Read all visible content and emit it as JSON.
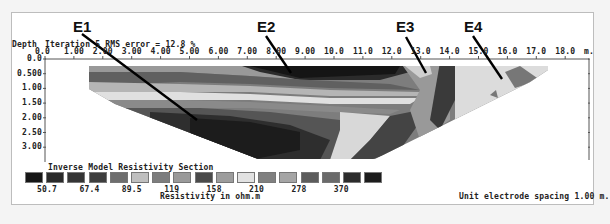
{
  "chart_data": {
    "type": "heatmap",
    "title": "Inverse Model Resistivity Section",
    "header": "Iteration 5 RMS error = 12.8 %",
    "xlabel": "m.",
    "ylabel": "Depth",
    "x_ticks": [
      "0.0",
      "1.00",
      "2.00",
      "3.00",
      "4.00",
      "5.00",
      "6.00",
      "7.00",
      "8.00",
      "9.00",
      "10.0",
      "11.0",
      "12.0",
      "13.0",
      "14.0",
      "15.0",
      "16.0",
      "17.0",
      "18.0"
    ],
    "y_ticks": [
      "0.0",
      "0.500",
      "1.00",
      "1.50",
      "2.00",
      "2.50",
      "3.00"
    ],
    "xlim": [
      0,
      18.5
    ],
    "ylim": [
      0,
      3.4
    ],
    "colorbar": {
      "label": "Resistivity in ohm.m",
      "tick_labels": [
        "50.7",
        "67.4",
        "89.5",
        "119",
        "158",
        "210",
        "278",
        "370"
      ],
      "colors": [
        "#161616",
        "#2a2a2a",
        "#353535",
        "#3e3e3e",
        "#6e6e6e",
        "#bfbfbf",
        "#7d7d7d",
        "#9a9a9a",
        "#4a4a4a",
        "#9c9c9c",
        "#e2e2e2",
        "#808080",
        "#a5a5a5",
        "#5c5c5c",
        "#6a6a6a",
        "#2c2c2c",
        "#1c1c1c"
      ]
    },
    "annotations": [
      {
        "label": "E1",
        "x_m": 3.9,
        "depth_m": 2.1
      },
      {
        "label": "E2",
        "x_m": 8.2,
        "depth_m": 0.55
      },
      {
        "label": "E3",
        "x_m": 13.3,
        "depth_m": 0.55
      },
      {
        "label": "E4",
        "x_m": 16.0,
        "depth_m": 0.7
      }
    ],
    "footer": "Unit electrode spacing 1.00 m."
  },
  "labels": {
    "depth": "Depth",
    "header": "Iteration 5 RMS error = 12.8 %",
    "unit_m": "m.",
    "section_title": "Inverse Model Resistivity Section",
    "colorbar_label": "Resistivity in ohm.m",
    "footer": "Unit electrode spacing 1.00 m.",
    "e1": "E1",
    "e2": "E2",
    "e3": "E3",
    "e4": "E4"
  }
}
